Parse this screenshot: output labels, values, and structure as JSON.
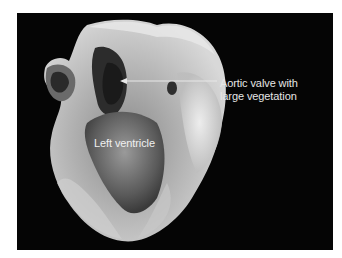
{
  "figure": {
    "background_color": "#050505",
    "annotations": [
      {
        "id": "aortic",
        "lines": [
          "Aortic valve with",
          "large vegetation"
        ],
        "has_arrow": true
      },
      {
        "id": "lv",
        "lines": [
          "Left ventricle"
        ],
        "has_arrow": false
      }
    ]
  }
}
